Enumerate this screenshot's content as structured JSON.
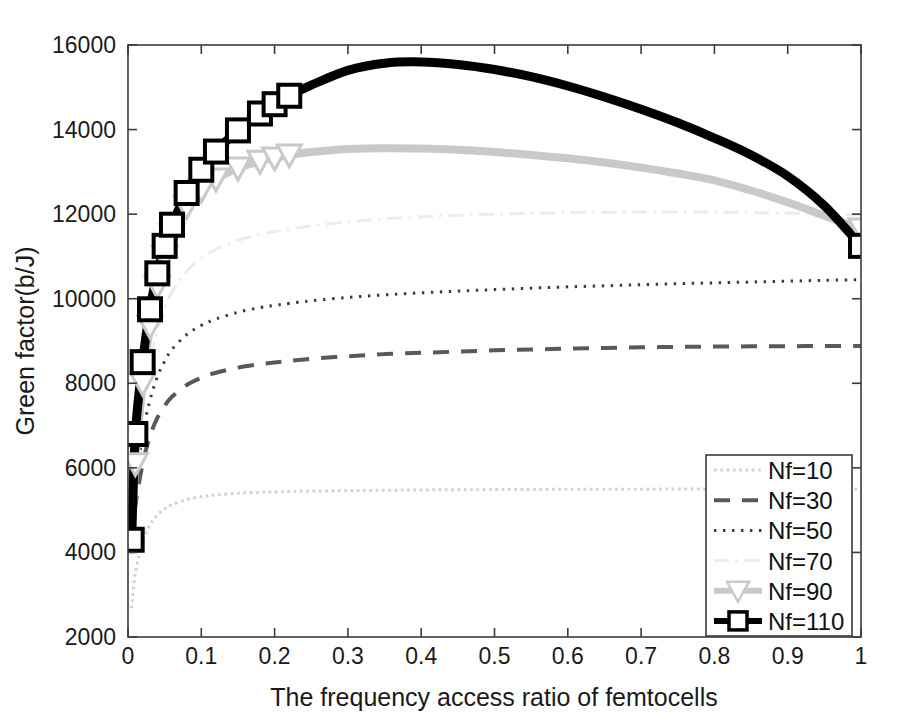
{
  "chart_data": {
    "type": "line",
    "title": "",
    "xlabel": "The frequency access ratio of femtocells",
    "ylabel": "Green factor(b/J)",
    "xlim": [
      0,
      1
    ],
    "ylim": [
      2000,
      16000
    ],
    "xticks": [
      "0",
      "0.1",
      "0.2",
      "0.3",
      "0.4",
      "0.5",
      "0.6",
      "0.7",
      "0.8",
      "0.9",
      "1"
    ],
    "xtick_values": [
      0,
      0.1,
      0.2,
      0.3,
      0.4,
      0.5,
      0.6,
      0.7,
      0.8,
      0.9,
      1
    ],
    "yticks": [
      "2000",
      "4000",
      "6000",
      "8000",
      "10000",
      "12000",
      "14000",
      "16000"
    ],
    "ytick_values": [
      2000,
      4000,
      6000,
      8000,
      10000,
      12000,
      14000,
      16000
    ],
    "grid": false,
    "legend_position": "lower-right",
    "x": [
      0.005,
      0.01,
      0.02,
      0.03,
      0.04,
      0.05,
      0.06,
      0.08,
      0.1,
      0.12,
      0.15,
      0.18,
      0.2,
      0.22,
      0.25,
      0.3,
      0.35,
      0.4,
      0.45,
      0.5,
      0.55,
      0.6,
      0.65,
      0.7,
      0.75,
      0.8,
      0.85,
      0.9,
      0.95,
      1.0
    ],
    "series": [
      {
        "name": "Nf=10",
        "color": "#d2d2d2",
        "style": "dotted",
        "width": 3,
        "marker": "none",
        "values": [
          2680,
          3500,
          4250,
          4650,
          4880,
          5030,
          5130,
          5250,
          5320,
          5360,
          5400,
          5420,
          5430,
          5440,
          5450,
          5460,
          5470,
          5478,
          5482,
          5486,
          5490,
          5492,
          5494,
          5496,
          5498,
          5500,
          5500,
          5500,
          5500,
          5500
        ]
      },
      {
        "name": "Nf=30",
        "color": "#595959",
        "style": "dashed",
        "width": 4,
        "marker": "none",
        "values": [
          4300,
          5100,
          6100,
          6750,
          7180,
          7470,
          7680,
          7960,
          8130,
          8250,
          8370,
          8450,
          8490,
          8530,
          8580,
          8640,
          8690,
          8720,
          8750,
          8780,
          8800,
          8820,
          8835,
          8850,
          8860,
          8868,
          8874,
          8878,
          8880,
          8882
        ]
      },
      {
        "name": "Nf=50",
        "color": "#3a3a3a",
        "style": "dotted-fine",
        "width": 3,
        "marker": "none",
        "values": [
          4300,
          5500,
          6800,
          7600,
          8150,
          8520,
          8800,
          9150,
          9370,
          9520,
          9680,
          9790,
          9840,
          9890,
          9950,
          10030,
          10090,
          10140,
          10180,
          10215,
          10250,
          10280,
          10305,
          10330,
          10355,
          10375,
          10395,
          10415,
          10435,
          10450
        ]
      },
      {
        "name": "Nf=70",
        "color": "#ececec",
        "style": "dashdot",
        "width": 3,
        "marker": "none",
        "values": [
          4300,
          5800,
          7400,
          8500,
          9250,
          9780,
          10150,
          10650,
          10960,
          11170,
          11380,
          11520,
          11590,
          11650,
          11720,
          11820,
          11890,
          11940,
          11975,
          12000,
          12020,
          12035,
          12045,
          12050,
          12050,
          12045,
          12035,
          12020,
          12000,
          11980
        ]
      },
      {
        "name": "Nf=90",
        "color": "#c9c9c9",
        "style": "solid",
        "width": 8,
        "marker": "triangle-down",
        "values": [
          4300,
          6100,
          8000,
          9350,
          10300,
          11000,
          11520,
          12180,
          12570,
          12830,
          13090,
          13250,
          13330,
          13400,
          13470,
          13540,
          13560,
          13550,
          13520,
          13470,
          13400,
          13320,
          13220,
          13100,
          12960,
          12800,
          12560,
          12280,
          11960,
          11650
        ]
      },
      {
        "name": "Nf=110",
        "color": "#000000",
        "style": "solid",
        "width": 9,
        "marker": "square",
        "values": [
          4300,
          6800,
          8500,
          9750,
          10600,
          11250,
          11750,
          12500,
          13050,
          13480,
          13980,
          14380,
          14600,
          14800,
          15050,
          15400,
          15570,
          15600,
          15540,
          15420,
          15250,
          15030,
          14770,
          14480,
          14160,
          13800,
          13400,
          12900,
          12200,
          11250
        ]
      }
    ]
  },
  "legend": {
    "entries": [
      {
        "label": "Nf=10"
      },
      {
        "label": "Nf=30"
      },
      {
        "label": "Nf=50"
      },
      {
        "label": "Nf=70"
      },
      {
        "label": "Nf=90"
      },
      {
        "label": "Nf=110"
      }
    ]
  }
}
